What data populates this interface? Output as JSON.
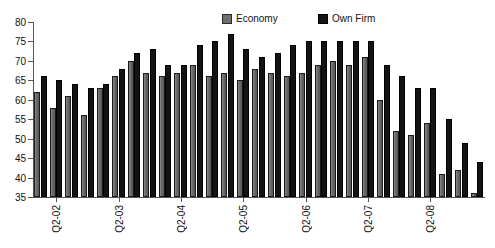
{
  "chart_data": {
    "type": "bar",
    "title": "",
    "subtitle": "",
    "xlabel": "",
    "ylabel": "",
    "ylim": [
      35,
      80
    ],
    "ytick_step": 5,
    "yticks": [
      35,
      40,
      45,
      50,
      55,
      60,
      65,
      70,
      75,
      80
    ],
    "grid": false,
    "legend_position": "top-center",
    "categories": [
      "Q1-02",
      "Q2-02",
      "Q3-02",
      "Q4-02",
      "Q1-03",
      "Q2-03",
      "Q3-03",
      "Q4-03",
      "Q1-04",
      "Q2-04",
      "Q3-04",
      "Q4-04",
      "Q1-05",
      "Q2-05",
      "Q3-05",
      "Q4-05",
      "Q1-06",
      "Q2-06",
      "Q3-06",
      "Q4-06",
      "Q1-07",
      "Q2-07",
      "Q3-07",
      "Q4-07",
      "Q1-08",
      "Q2-08",
      "Q3-08",
      "Q4-08",
      "Q1-09"
    ],
    "tick_labels": [
      "Q2-02",
      "Q2-03",
      "Q2-04",
      "Q2-05",
      "Q2-06",
      "Q2-07",
      "Q2-08"
    ],
    "tick_label_indices": [
      1,
      5,
      9,
      13,
      17,
      21,
      25
    ],
    "series": [
      {
        "name": "Economy",
        "color": "#6b6b6b",
        "values": [
          62,
          58,
          61,
          56,
          63,
          66,
          70,
          67,
          66,
          67,
          69,
          66,
          67,
          65,
          68,
          67,
          66,
          67,
          69,
          70,
          69,
          71,
          60,
          52,
          51,
          54,
          41,
          42,
          36
        ]
      },
      {
        "name": "Own Firm",
        "color": "#131313",
        "values": [
          66,
          65,
          64,
          63,
          64,
          68,
          72,
          73,
          69,
          69,
          74,
          75,
          77,
          73,
          71,
          72,
          74,
          75,
          75,
          75,
          75,
          75,
          69,
          66,
          63,
          63,
          55,
          49,
          44
        ]
      }
    ]
  },
  "legend": {
    "entries": [
      {
        "label": "Economy",
        "swatch": "gray-square-icon"
      },
      {
        "label": "Own Firm",
        "swatch": "black-square-icon"
      }
    ]
  }
}
